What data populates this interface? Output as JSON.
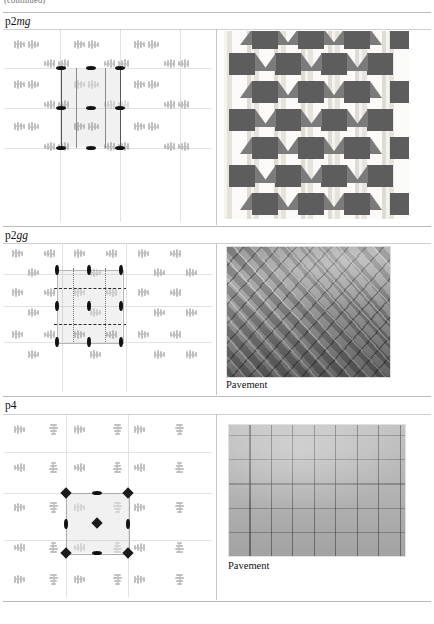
{
  "page": {
    "continued_header": "(continued)",
    "background": "#ffffff",
    "rule_color": "#b9b9b9"
  },
  "rows": [
    {
      "id": "p2mg",
      "group_prefix": "p2",
      "group_suffix": "mg",
      "label_full": "p2mg",
      "diagram": {
        "name": "p2mg-symmetry-diagram",
        "cell_type": "rectangle",
        "features": [
          "mirror-lines-vertical",
          "two-fold-rotation-centers",
          "unit-cell-highlight"
        ],
        "motif_color": "#8e8e8e",
        "marker_color": "#111111",
        "grid_color": "#e2e2e2"
      },
      "photo": {
        "name": "p2mg-tiling-photo",
        "kind": "geometric-tiling",
        "dark_color": "#5d5d5d",
        "light_color": "#f2f0ee",
        "caption": ""
      }
    },
    {
      "id": "p2gg",
      "group_prefix": "p2",
      "group_suffix": "gg",
      "label_full": "p2gg",
      "diagram": {
        "name": "p2gg-symmetry-diagram",
        "cell_type": "rectangle",
        "features": [
          "glide-lines-horizontal",
          "glide-lines-vertical",
          "two-fold-rotation-centers",
          "unit-cell-highlight"
        ],
        "motif_color": "#8e8e8e",
        "marker_color": "#111111",
        "grid_color": "#e2e2e2"
      },
      "photo": {
        "name": "p2gg-pavement-photo",
        "kind": "herringbone-brick-pavement",
        "caption": "Pavement"
      }
    },
    {
      "id": "p4",
      "group_prefix": "p",
      "group_suffix": "4",
      "label_full": "p4",
      "diagram": {
        "name": "p4-symmetry-diagram",
        "cell_type": "square",
        "features": [
          "four-fold-rotation-centers",
          "two-fold-rotation-centers",
          "unit-cell-highlight"
        ],
        "motif_color": "#8e8e8e",
        "marker_color": "#1b1b1b",
        "grid_color": "#e2e2e2"
      },
      "photo": {
        "name": "p4-pavement-photo",
        "kind": "interlocking-wavy-pavers",
        "caption": "Pavement"
      }
    }
  ]
}
